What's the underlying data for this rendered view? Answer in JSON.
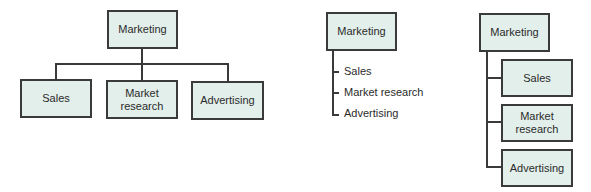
{
  "colors": {
    "box_fill": "#e2efea",
    "border": "#3a3a3a",
    "text": "#2b2b2b"
  },
  "diagrams": [
    {
      "layout": "horizontal-tree",
      "root": "Marketing",
      "children": [
        "Sales",
        "Market\nresearch",
        "Advertising"
      ]
    },
    {
      "layout": "indented-list",
      "root": "Marketing",
      "children": [
        "Sales",
        "Market research",
        "Advertising"
      ]
    },
    {
      "layout": "vertical-tree",
      "root": "Marketing",
      "children": [
        "Sales",
        "Market\nresearch",
        "Advertising"
      ]
    }
  ]
}
